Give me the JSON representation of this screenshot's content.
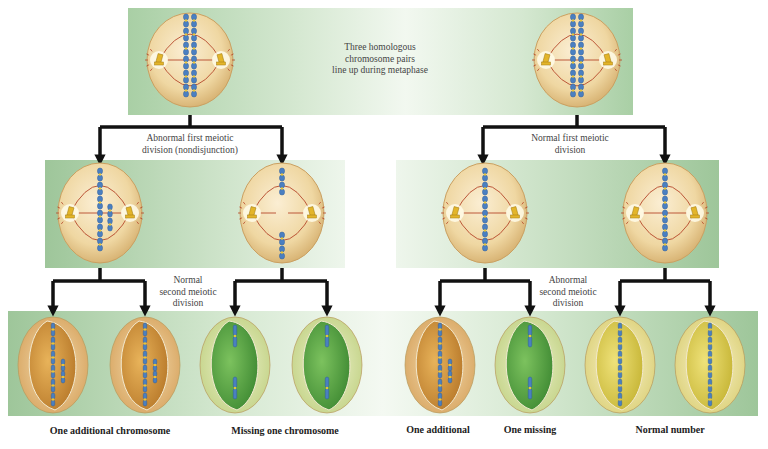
{
  "diagram": {
    "title_note": "Three homologous chromosome pairs line up during metaphase",
    "top_label_lines": [
      "Three homologous",
      "chromosome pairs",
      "line up during metaphase"
    ],
    "left_branch": {
      "first_division_lines": [
        "Abnormal first meiotic",
        "division (nondisjunction)"
      ],
      "second_division_lines": [
        "Normal",
        "second meiotic",
        "division"
      ],
      "captions": [
        "One additional chromosome",
        "Missing one chromosome"
      ]
    },
    "right_branch": {
      "first_division_lines": [
        "Normal first meiotic",
        "division"
      ],
      "second_division_lines": [
        "Abnormal",
        "second meiotic",
        "division"
      ],
      "captions": [
        "One additional",
        "One missing",
        "Normal number"
      ]
    },
    "cells": {
      "parent_cells": 2,
      "intermediate_cells": 4,
      "gametes": [
        {
          "group": "left",
          "type": "extra",
          "color": "orange"
        },
        {
          "group": "left",
          "type": "extra",
          "color": "orange"
        },
        {
          "group": "left",
          "type": "missing",
          "color": "green"
        },
        {
          "group": "left",
          "type": "missing",
          "color": "green"
        },
        {
          "group": "right",
          "type": "extra",
          "color": "orange"
        },
        {
          "group": "right",
          "type": "missing",
          "color": "green"
        },
        {
          "group": "right",
          "type": "normal",
          "color": "yellow"
        },
        {
          "group": "right",
          "type": "normal",
          "color": "yellow"
        }
      ]
    },
    "colors": {
      "chromosome": "#4a7fc1",
      "centromere": "#e8c53a",
      "spindle": "#b5472a",
      "cell_fill": "#f0d9a6",
      "gamete_orange": "#d69a3c",
      "gamete_green": "#5ea54a",
      "gamete_yellow": "#d9cc4a",
      "arrow": "#111111"
    }
  }
}
